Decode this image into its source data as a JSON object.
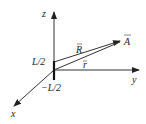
{
  "diagram": {
    "type": "coordinate-system-vectors",
    "axes": {
      "z": "z",
      "y": "y",
      "x": "x"
    },
    "wire_labels": {
      "top": "L/2",
      "bottom": "−L/2"
    },
    "vectors": {
      "R": "R",
      "r": "r"
    },
    "point": "A",
    "colors": {
      "line": "#333333",
      "text": "#222222",
      "background": "#ffffff"
    }
  }
}
